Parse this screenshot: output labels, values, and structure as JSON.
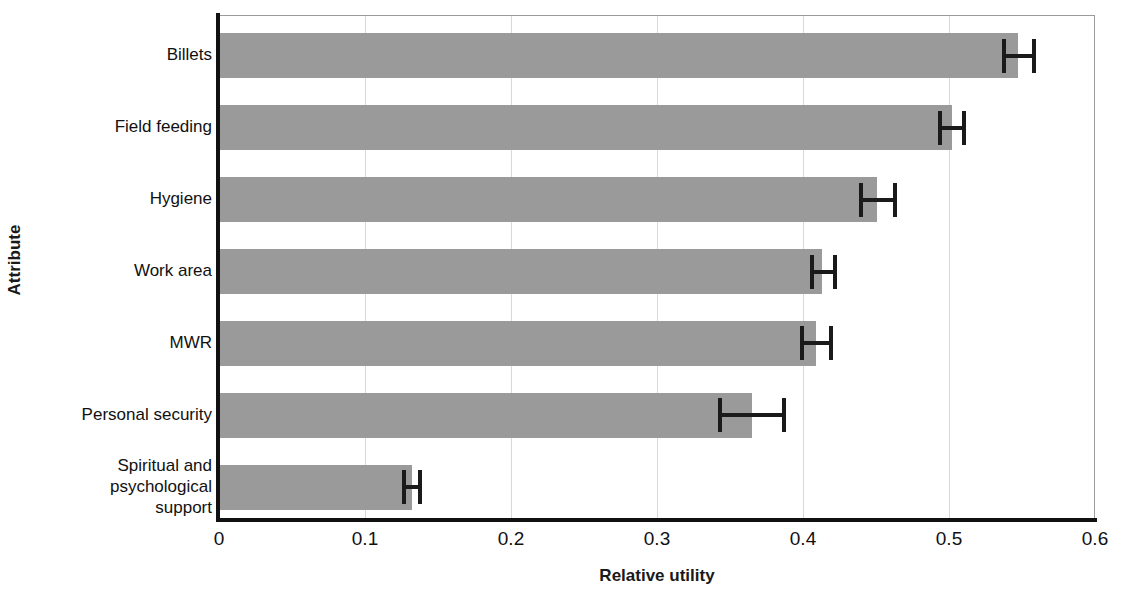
{
  "chart_data": {
    "type": "bar",
    "orientation": "horizontal",
    "title": "",
    "xlabel": "Relative utility",
    "ylabel": "Attribute",
    "categories": [
      "Billets",
      "Field feeding",
      "Hygiene",
      "Work area",
      "MWR",
      "Personal security",
      "Spiritual and psychological support"
    ],
    "values": [
      0.547,
      0.502,
      0.451,
      0.413,
      0.409,
      0.365,
      0.132
    ],
    "error_low": [
      0.538,
      0.494,
      0.44,
      0.406,
      0.399,
      0.343,
      0.127
    ],
    "error_high": [
      0.558,
      0.51,
      0.463,
      0.422,
      0.419,
      0.387,
      0.138
    ],
    "xlim": [
      0,
      0.6
    ],
    "xticks": [
      0,
      0.1,
      0.2,
      0.3,
      0.4,
      0.5,
      0.6
    ],
    "xtick_labels": [
      "0",
      "0.1",
      "0.2",
      "0.3",
      "0.4",
      "0.5",
      "0.6"
    ],
    "grid": "vertical",
    "legend": "none",
    "bar_color": "#9a9a9a",
    "error_color": "#1a1a1a",
    "axis_color": "#111111",
    "gridline_color": "#d8d8d8"
  },
  "axes": {
    "y_title": "Attribute",
    "x_title": "Relative utility"
  },
  "category_labels": [
    {
      "lines": [
        "Billets"
      ]
    },
    {
      "lines": [
        "Field feeding"
      ]
    },
    {
      "lines": [
        "Hygiene"
      ]
    },
    {
      "lines": [
        "Work area"
      ]
    },
    {
      "lines": [
        "MWR"
      ]
    },
    {
      "lines": [
        "Personal security"
      ]
    },
    {
      "lines": [
        "Spiritual and",
        "psychological",
        "support"
      ]
    }
  ]
}
